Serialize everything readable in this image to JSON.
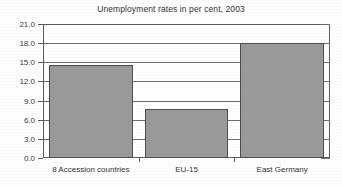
{
  "chart_data": {
    "type": "bar",
    "title": "Unemployment rates in per cent, 2003",
    "xlabel": "",
    "ylabel": "",
    "categories": [
      "8 Accession countries",
      "EU-15",
      "East Germany"
    ],
    "values": [
      14.6,
      7.7,
      18.0
    ],
    "ylim": [
      0.0,
      21.0
    ],
    "ytick_step": 3.0,
    "ytick_labels": [
      "0.0",
      "3.0",
      "6.0",
      "9.0",
      "12.0",
      "15.0",
      "18.0",
      "21.0"
    ],
    "ytick_values": [
      0.0,
      3.0,
      6.0,
      9.0,
      12.0,
      15.0,
      18.0,
      21.0
    ],
    "grid": true,
    "legend": false,
    "legend_position": "none",
    "series": [
      {
        "name": "Unemployment rate",
        "values": [
          14.6,
          7.7,
          18.0
        ]
      }
    ],
    "colors": {
      "bar_fill": "#9a9a9a",
      "bar_border": "#4f4f4f",
      "grid": "#6d6d6d",
      "frame": "#5b5b5b",
      "background": "#ffffff",
      "text": "#33332f"
    }
  }
}
